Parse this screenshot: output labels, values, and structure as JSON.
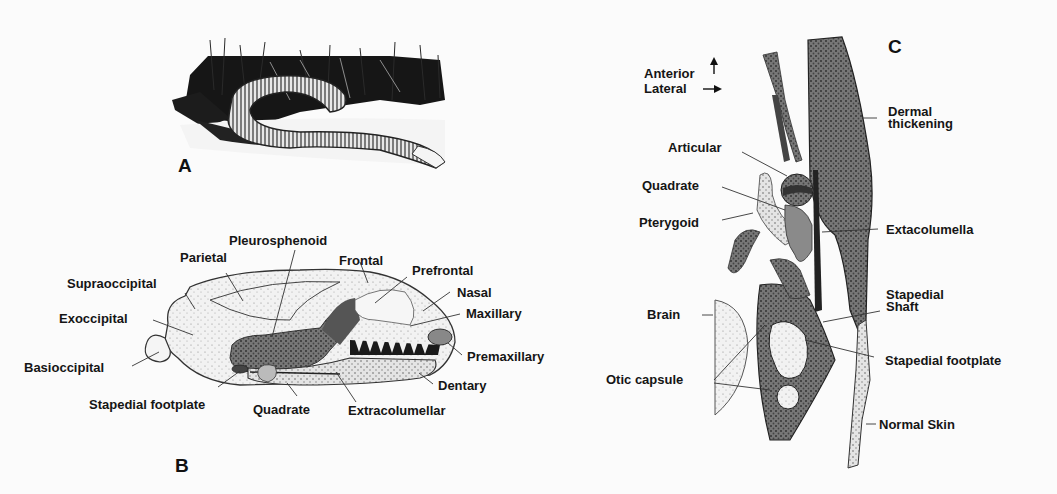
{
  "figure": {
    "panels": [
      {
        "id": "A",
        "letter": "A",
        "description": "Illustration of a caecilian (limbless amphibian) coiled in grass"
      },
      {
        "id": "B",
        "letter": "B",
        "description": "Lateral view of caecilian skull",
        "labels": [
          "Pleurosphenoid",
          "Parietal",
          "Frontal",
          "Prefrontal",
          "Supraoccipital",
          "Nasal",
          "Maxillary",
          "Exoccipital",
          "Basioccipital",
          "Premaxillary",
          "Dentary",
          "Stapedial footplate",
          "Quadrate",
          "Extracolumellar"
        ]
      },
      {
        "id": "C",
        "letter": "C",
        "description": "Cross-section showing middle ear region",
        "orientation": {
          "anterior": "Anterior",
          "lateral": "Lateral"
        },
        "labels": [
          "Dermal thickening",
          "Articular",
          "Quadrate",
          "Pterygoid",
          "Extacolumella",
          "Brain",
          "Stapedial Shaft",
          "Stapedial footplate",
          "Otic capsule",
          "Normal Skin"
        ]
      }
    ]
  },
  "panelA": {
    "letter": "A"
  },
  "panelB": {
    "letter": "B",
    "pleurosphenoid": "Pleurosphenoid",
    "parietal": "Parietal",
    "frontal": "Frontal",
    "prefrontal": "Prefrontal",
    "supraoccipital": "Supraoccipital",
    "nasal": "Nasal",
    "maxillary": "Maxillary",
    "exoccipital": "Exoccipital",
    "basioccipital": "Basioccipital",
    "premaxillary": "Premaxillary",
    "dentary": "Dentary",
    "stapedial_footplate": "Stapedial footplate",
    "quadrate": "Quadrate",
    "extracolumellar": "Extracolumellar"
  },
  "panelC": {
    "letter": "C",
    "anterior": "Anterior",
    "lateral": "Lateral",
    "dermal_thickening": "Dermal\nthickening",
    "articular": "Articular",
    "quadrate": "Quadrate",
    "pterygoid": "Pterygoid",
    "extacolumella": "Extacolumella",
    "brain": "Brain",
    "stapedial_shaft": "Stapedial\nShaft",
    "stapedial_footplate": "Stapedial footplate",
    "otic_capsule": "Otic capsule",
    "normal_skin": "Normal Skin"
  }
}
